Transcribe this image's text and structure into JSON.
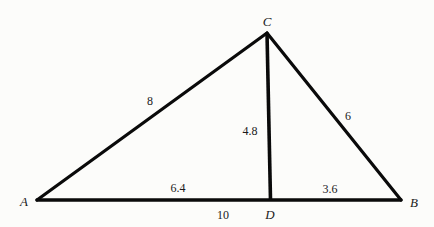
{
  "figure": {
    "type": "right-triangle-with-altitude",
    "stroke_color": "#0a0a0a",
    "background_color": "#fcfcfa",
    "vertices": {
      "A": {
        "label": "A",
        "x": 37,
        "y": 200
      },
      "B": {
        "label": "B",
        "x": 401,
        "y": 200
      },
      "C": {
        "label": "C",
        "x": 267,
        "y": 33
      },
      "D": {
        "label": "D",
        "x": 270,
        "y": 200
      }
    },
    "segments": [
      {
        "name": "AC",
        "from": "A",
        "to": "C",
        "length_label": "8"
      },
      {
        "name": "CB",
        "from": "C",
        "to": "B",
        "length_label": "6"
      },
      {
        "name": "AB",
        "from": "A",
        "to": "B",
        "length_label": "10"
      },
      {
        "name": "CD",
        "from": "C",
        "to": "D",
        "length_label": "4.8"
      },
      {
        "name": "AD",
        "from": "A",
        "to": "D",
        "length_label": "6.4"
      },
      {
        "name": "DB",
        "from": "D",
        "to": "B",
        "length_label": "3.6"
      }
    ]
  },
  "labels": {
    "vertex_a": "A",
    "vertex_b": "B",
    "vertex_c": "C",
    "vertex_d": "D",
    "side_ac": "8",
    "side_cb": "6",
    "side_ab": "10",
    "altitude_cd": "4.8",
    "segment_ad": "6.4",
    "segment_db": "3.6"
  }
}
